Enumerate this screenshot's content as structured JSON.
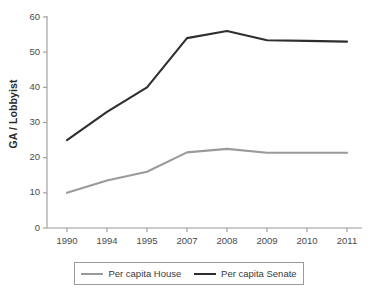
{
  "chart_data": {
    "type": "line",
    "title": "",
    "xlabel": "",
    "ylabel": "GA / Lobbyist",
    "categories": [
      "1990",
      "1994",
      "1995",
      "2007",
      "2008",
      "2009",
      "2010",
      "2011"
    ],
    "ylim": [
      0,
      60
    ],
    "yticks": [
      "0",
      "10",
      "20",
      "30",
      "40",
      "50",
      "60"
    ],
    "grid": false,
    "legend_position": "bottom",
    "series": [
      {
        "name": "Per capita House",
        "color": "#9a9a9a",
        "values": [
          10,
          13.5,
          16,
          21.5,
          22.5,
          21.4,
          21.4,
          21.4
        ]
      },
      {
        "name": "Per capita Senate",
        "color": "#2e2e2e",
        "values": [
          25,
          33,
          40,
          54,
          56,
          53.4,
          53.2,
          53
        ]
      }
    ]
  },
  "axis": {
    "line_color": "#9a9a9a",
    "tick_color": "#9a9a9a"
  }
}
